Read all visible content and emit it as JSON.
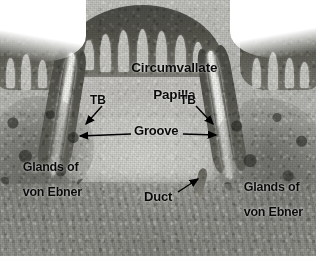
{
  "figure": {
    "kind": "histology-micrograph",
    "width_px": 316,
    "height_px": 261,
    "background_color": "#ffffff",
    "label_color": "#0a0a0a"
  },
  "labels": {
    "title_line1": "Circumvallate",
    "title_line2": "Papilla",
    "tb_left": "TB",
    "tb_right": "TB",
    "groove": "Groove",
    "glands_left_line1": "Glands of",
    "glands_left_line2": "von Ebner",
    "glands_right_line1": "Glands of",
    "glands_right_line2": "von Ebner",
    "duct": "Duct"
  },
  "annotations": [
    {
      "name": "tb-left-leader",
      "target": "taste buds in inner groove wall, left",
      "direction": "down-left"
    },
    {
      "name": "tb-right-leader",
      "target": "taste buds in inner groove wall, right",
      "direction": "down-right"
    },
    {
      "name": "groove-leader-left",
      "target": "left limb of circular groove",
      "direction": "left"
    },
    {
      "name": "groove-leader-right",
      "target": "right limb of circular groove",
      "direction": "right"
    },
    {
      "name": "duct-leader",
      "target": "von Ebner gland duct opening into groove floor",
      "direction": "up-right"
    }
  ],
  "structures": [
    {
      "name": "papilla-dome",
      "description": "Dome-shaped circumvallate papilla with light connective tissue core"
    },
    {
      "name": "epithelium-cap",
      "description": "Dark stratified squamous epithelium covering the papilla surface"
    },
    {
      "name": "groove-left",
      "description": "Bright circular groove (trench), left limb"
    },
    {
      "name": "groove-right",
      "description": "Bright circular groove (trench), right limb"
    },
    {
      "name": "glands-of-von-ebner-left",
      "description": "Serous von Ebner gland acini, left"
    },
    {
      "name": "glands-of-von-ebner-right",
      "description": "Serous von Ebner gland acini, right"
    },
    {
      "name": "duct-channel",
      "description": "Excretory duct draining into the base of the groove"
    },
    {
      "name": "lateral-mucosa-left",
      "description": "Adjacent lingual mucosa epithelium, left"
    },
    {
      "name": "lateral-mucosa-right",
      "description": "Adjacent lingual mucosa epithelium, right"
    }
  ]
}
